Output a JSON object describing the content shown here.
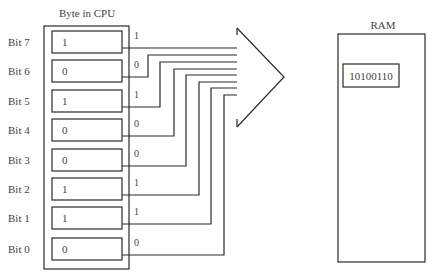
{
  "cpu": {
    "title": "Byte in CPU",
    "bits": [
      {
        "label": "Bit 7",
        "value": "1"
      },
      {
        "label": "Bit 6",
        "value": "0"
      },
      {
        "label": "Bit 5",
        "value": "1"
      },
      {
        "label": "Bit 4",
        "value": "0"
      },
      {
        "label": "Bit 3",
        "value": "0"
      },
      {
        "label": "Bit 2",
        "value": "1"
      },
      {
        "label": "Bit 1",
        "value": "1"
      },
      {
        "label": "Bit 0",
        "value": "0"
      }
    ]
  },
  "ram": {
    "title": "RAM",
    "stored_byte": "10100110"
  }
}
